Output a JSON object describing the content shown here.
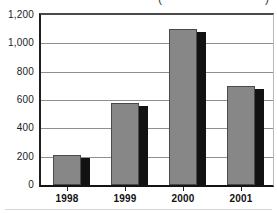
{
  "chart_data": {
    "type": "bar",
    "categories": [
      "1998",
      "1999",
      "2000",
      "2001"
    ],
    "values": [
      210,
      580,
      1100,
      700
    ],
    "title": "",
    "clipped_title": {
      "left_glyph": "(",
      "right_glyph": ")"
    },
    "xlabel": "",
    "ylabel": "",
    "ylim": [
      0,
      1200
    ],
    "ytick_interval": 200,
    "yticks": [
      "0",
      "200",
      "400",
      "600",
      "800",
      "1,000",
      "1,200"
    ],
    "grid": true,
    "legend": false,
    "bar_color": "#878787",
    "bar_border_color": "#4a4a4a",
    "shadow_color": "#121212",
    "gridline_color": "#8f8f8f",
    "axis_color": "#1f1f1f"
  }
}
